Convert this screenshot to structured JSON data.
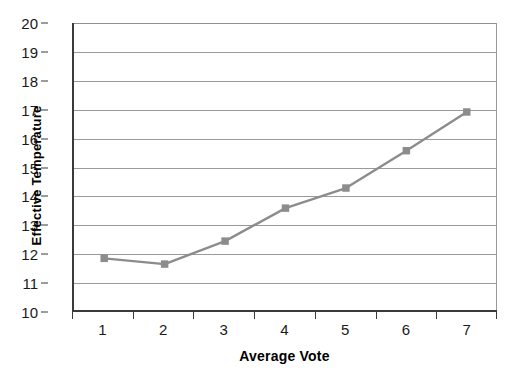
{
  "chart_data": {
    "type": "line",
    "title": "",
    "xlabel": "Average Vote",
    "ylabel": "Effective Temperature",
    "categories": [
      "1",
      "2",
      "3",
      "4",
      "5",
      "6",
      "7"
    ],
    "values": [
      11.8,
      11.6,
      12.4,
      13.55,
      14.25,
      15.55,
      16.9
    ],
    "series": [
      {
        "name": "Effective Temperature",
        "values": [
          11.8,
          11.6,
          12.4,
          13.55,
          14.25,
          15.55,
          16.9
        ]
      }
    ],
    "ylim": [
      10,
      20
    ],
    "y_ticks": [
      10,
      11,
      12,
      13,
      14,
      15,
      16,
      17,
      18,
      19,
      20
    ],
    "y_tick_labels": [
      "10",
      "11",
      "12",
      "13",
      "14",
      "15",
      "16",
      "17",
      "18",
      "19",
      "20"
    ],
    "x_tick_labels": [
      "1",
      "2",
      "3",
      "4",
      "5",
      "6",
      "7"
    ],
    "grid": true,
    "grid_axis": "y",
    "legend": false,
    "legend_position": "none",
    "marker": "square",
    "colors": {
      "line": "#8c8c8c",
      "marker": "#8c8c8c",
      "gridline": "#9a9a9a",
      "axis": "#3a3a3a",
      "text": "#000000",
      "background": "#ffffff"
    }
  }
}
